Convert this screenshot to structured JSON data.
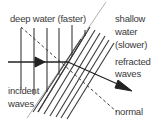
{
  "diagram": {
    "labels": {
      "deep_water": "deep water (faster)",
      "shallow_line1": "shallow",
      "shallow_line2": "water",
      "shallow_line3": "(slower)",
      "refracted_line1": "refracted",
      "refracted_line2": "waves",
      "incident_line1": "incident",
      "incident_line2": "waves",
      "normal": "normal"
    },
    "colors": {
      "line": "#3a3a3a",
      "boundary": "#8a8a8a",
      "text": "#3a3a3a",
      "background": "#ffffff"
    },
    "elements": {
      "incident_wavefronts": 6,
      "refracted_wavefronts": 10,
      "boundary": "diagonal line separating deep and shallow water",
      "normal": "dashed line perpendicular to boundary",
      "ray": "arrowed ray bending toward normal on entering shallow water"
    }
  }
}
